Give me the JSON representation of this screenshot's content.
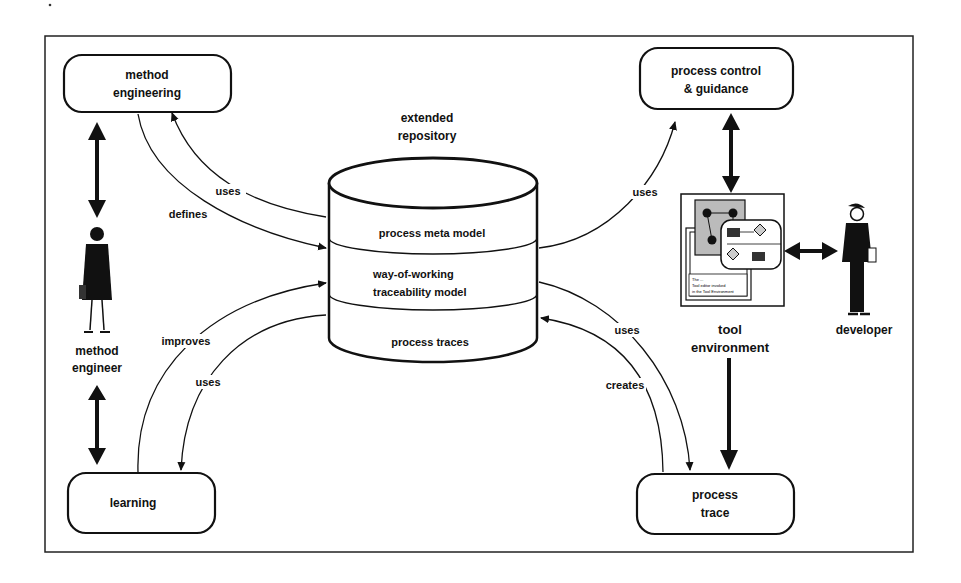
{
  "diagram": {
    "repository": {
      "title_line1": "extended",
      "title_line2": "repository",
      "layers": [
        "process meta model",
        "way-of-working",
        "traceability model",
        "process traces"
      ]
    },
    "nodes": {
      "method_engineering": [
        "method",
        "engineering"
      ],
      "process_control": [
        "process control",
        "& guidance"
      ],
      "learning": [
        "learning"
      ],
      "process_trace": [
        "process",
        "trace"
      ],
      "tool_environment": [
        "tool",
        "environment"
      ]
    },
    "actors": {
      "method_engineer": [
        "method",
        "engineer"
      ],
      "developer": [
        "developer"
      ]
    },
    "edges": {
      "me_uses": "uses",
      "me_defines": "defines",
      "learn_improves": "improves",
      "learn_uses": "uses",
      "pc_uses": "uses",
      "pt_uses": "uses",
      "pt_creates": "creates"
    },
    "tool_screen_text": [
      "The ...",
      "Tool editor invoked",
      "in the Tool Environment"
    ]
  }
}
